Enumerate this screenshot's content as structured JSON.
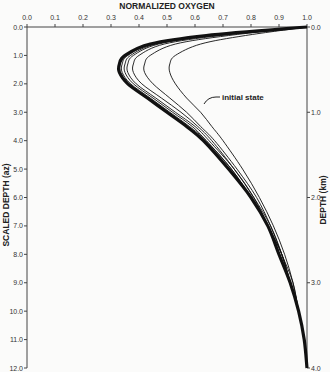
{
  "chart_data": {
    "type": "line",
    "title": "NORMALIZED OXYGEN",
    "xlabel": "NORMALIZED OXYGEN",
    "ylabel": "SCALED DEPTH (az)",
    "ylabel_right": "DEPTH (km)",
    "xlim": [
      0.0,
      1.0
    ],
    "ylim": [
      12.0,
      0.0
    ],
    "ylim_right": [
      4.0,
      0.0
    ],
    "x_ticks": [
      "0.0",
      "0.1",
      "0.2",
      "0.3",
      "0.4",
      "0.5",
      "0.6",
      "0.7",
      "0.8",
      "0.9",
      "1.0"
    ],
    "y_ticks": [
      "0.0",
      "1.0",
      "2.0",
      "3.0",
      "4.0",
      "5.0",
      "6.0",
      "7.0",
      "8.0",
      "9.0",
      "10.0",
      "11.0",
      "12.0"
    ],
    "y_ticks_right": [
      "0.0",
      "1.0",
      "2.0",
      "3.0",
      "4.0"
    ],
    "annotation": "initial state",
    "grid": false,
    "depth": [
      0.0,
      0.3,
      0.6,
      1.0,
      1.3,
      1.6,
      2.0,
      2.5,
      3.0,
      3.5,
      4.0,
      5.0,
      6.0,
      7.0,
      8.0,
      9.0,
      10.0,
      11.0,
      12.0
    ],
    "series": [
      {
        "name": "initial state",
        "values": [
          1.0,
          0.78,
          0.62,
          0.53,
          0.51,
          0.51,
          0.53,
          0.57,
          0.62,
          0.66,
          0.7,
          0.77,
          0.83,
          0.88,
          0.92,
          0.95,
          0.97,
          0.99,
          1.0
        ]
      },
      {
        "name": "curve 2",
        "values": [
          1.0,
          0.72,
          0.53,
          0.44,
          0.42,
          0.42,
          0.45,
          0.51,
          0.57,
          0.62,
          0.67,
          0.75,
          0.82,
          0.87,
          0.91,
          0.95,
          0.97,
          0.99,
          1.0
        ]
      },
      {
        "name": "curve 3",
        "values": [
          1.0,
          0.69,
          0.49,
          0.4,
          0.38,
          0.38,
          0.41,
          0.48,
          0.55,
          0.61,
          0.66,
          0.74,
          0.81,
          0.87,
          0.91,
          0.94,
          0.97,
          0.99,
          1.0
        ]
      },
      {
        "name": "curve 4",
        "values": [
          1.0,
          0.67,
          0.47,
          0.38,
          0.36,
          0.36,
          0.39,
          0.46,
          0.53,
          0.6,
          0.65,
          0.74,
          0.81,
          0.86,
          0.91,
          0.94,
          0.97,
          0.99,
          1.0
        ]
      },
      {
        "name": "curve 5",
        "values": [
          1.0,
          0.66,
          0.46,
          0.37,
          0.35,
          0.35,
          0.38,
          0.45,
          0.52,
          0.59,
          0.64,
          0.73,
          0.8,
          0.86,
          0.91,
          0.94,
          0.97,
          0.99,
          1.0
        ]
      },
      {
        "name": "curve 6",
        "values": [
          1.0,
          0.65,
          0.45,
          0.36,
          0.34,
          0.34,
          0.37,
          0.44,
          0.51,
          0.58,
          0.64,
          0.73,
          0.8,
          0.86,
          0.9,
          0.94,
          0.97,
          0.99,
          1.0
        ]
      },
      {
        "name": "curve 7 (steady)",
        "values": [
          1.0,
          0.64,
          0.44,
          0.35,
          0.33,
          0.33,
          0.36,
          0.43,
          0.5,
          0.57,
          0.63,
          0.72,
          0.8,
          0.86,
          0.9,
          0.94,
          0.97,
          0.99,
          1.0
        ]
      }
    ]
  }
}
